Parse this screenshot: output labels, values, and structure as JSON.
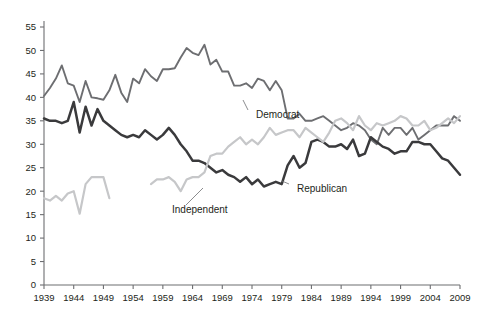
{
  "chart_data": {
    "type": "line",
    "title": "",
    "subtitle": "",
    "xlabel": "",
    "ylabel": "",
    "xlim": [
      1939,
      2009
    ],
    "ylim": [
      0,
      55
    ],
    "grid": false,
    "legend_position": "inline-annotations",
    "x_ticks": [
      1939,
      1944,
      1949,
      1954,
      1959,
      1964,
      1969,
      1974,
      1979,
      1984,
      1989,
      1994,
      1999,
      2004,
      2009
    ],
    "x_tick_labels": [
      "1939",
      "1944",
      "1949",
      "1954",
      "1959",
      "1964",
      "1969",
      "1974",
      "1979",
      "1984",
      "1989",
      "1994",
      "1999",
      "2004",
      "2009"
    ],
    "y_ticks": [
      0,
      5,
      10,
      15,
      20,
      25,
      30,
      35,
      40,
      45,
      50,
      55
    ],
    "y_tick_labels": [
      "0",
      "5",
      "10",
      "15",
      "20",
      "25",
      "30",
      "35",
      "40",
      "45",
      "50",
      "55"
    ],
    "annotations": [
      {
        "text": "Democrat",
        "x": 1972.0,
        "y": 37.0,
        "series": "Democrat"
      },
      {
        "text": "Independent",
        "x": 1966.0,
        "y": 13.5,
        "series": "Independent"
      },
      {
        "text": "Republican",
        "x": 1985.5,
        "y": 20.0,
        "series": "Republican"
      }
    ],
    "series": [
      {
        "name": "Democrat",
        "color": "#6d6e71",
        "x": [
          1939,
          1940,
          1941,
          1942,
          1943,
          1944,
          1945,
          1946,
          1947,
          1948,
          1949,
          1950,
          1951,
          1952,
          1953,
          1954,
          1955,
          1956,
          1957,
          1958,
          1959,
          1960,
          1961,
          1962,
          1963,
          1964,
          1965,
          1966,
          1967,
          1968,
          1969,
          1970,
          1971,
          1972,
          1973,
          1974,
          1975,
          1976,
          1977,
          1978,
          1979,
          1980,
          1981,
          1982,
          1983,
          1984,
          1985,
          1986,
          1987,
          1988,
          1989,
          1990,
          1991,
          1992,
          1993,
          1994,
          1995,
          1996,
          1997,
          1998,
          1999,
          2000,
          2001,
          2002,
          2003,
          2004,
          2005,
          2006,
          2007,
          2008,
          2009
        ],
        "y": [
          40.3,
          42.0,
          44.0,
          46.8,
          43.0,
          42.5,
          39.0,
          43.5,
          40.0,
          39.8,
          39.5,
          41.5,
          44.8,
          41.0,
          39.0,
          44.0,
          43.0,
          46.0,
          44.5,
          43.5,
          46.0,
          46.0,
          46.2,
          48.5,
          50.5,
          49.5,
          49.0,
          51.2,
          47.0,
          48.0,
          45.5,
          45.5,
          42.5,
          42.5,
          43.0,
          42.0,
          44.0,
          43.5,
          41.5,
          43.5,
          41.5,
          35.5,
          35.5,
          36.5,
          35.0,
          35.0,
          35.5,
          36.0,
          35.0,
          34.0,
          33.0,
          33.5,
          34.5,
          34.0,
          33.0,
          31.0,
          30.0,
          33.5,
          32.0,
          33.5,
          33.5,
          32.0,
          33.5,
          31.0,
          32.0,
          33.0,
          34.0,
          34.0,
          34.0,
          36.0,
          35.0
        ]
      },
      {
        "name": "Republican",
        "color": "#3a3a3c",
        "x": [
          1939,
          1940,
          1941,
          1942,
          1943,
          1944,
          1945,
          1946,
          1947,
          1948,
          1949,
          1950,
          1951,
          1952,
          1953,
          1954,
          1955,
          1956,
          1957,
          1958,
          1959,
          1960,
          1961,
          1962,
          1963,
          1964,
          1965,
          1966,
          1967,
          1968,
          1969,
          1970,
          1971,
          1972,
          1973,
          1974,
          1975,
          1976,
          1977,
          1978,
          1979,
          1980,
          1981,
          1982,
          1983,
          1984,
          1985,
          1986,
          1987,
          1988,
          1989,
          1990,
          1991,
          1992,
          1993,
          1994,
          1995,
          1996,
          1997,
          1998,
          1999,
          2000,
          2001,
          2002,
          2003,
          2004,
          2005,
          2006,
          2007,
          2008,
          2009
        ],
        "y": [
          35.5,
          35.0,
          35.0,
          34.5,
          35.0,
          39.0,
          32.5,
          38.0,
          34.0,
          37.5,
          35.0,
          34.0,
          33.0,
          32.0,
          31.5,
          32.0,
          31.5,
          33.0,
          32.0,
          31.0,
          32.0,
          33.5,
          32.0,
          30.0,
          28.5,
          26.5,
          26.5,
          26.0,
          25.0,
          24.0,
          24.5,
          23.5,
          23.0,
          22.0,
          23.0,
          21.5,
          22.5,
          21.0,
          21.5,
          22.0,
          21.5,
          25.5,
          27.5,
          25.0,
          26.0,
          30.5,
          31.0,
          30.5,
          29.5,
          29.5,
          30.0,
          29.0,
          31.0,
          27.5,
          28.0,
          31.5,
          30.5,
          29.5,
          29.0,
          28.0,
          28.5,
          28.5,
          30.5,
          30.5,
          30.0,
          30.0,
          28.5,
          27.0,
          26.5,
          25.0,
          23.5
        ]
      },
      {
        "name": "Independent",
        "color": "#c6c7c9",
        "x": [
          1939,
          1940,
          1941,
          1942,
          1943,
          1944,
          1945,
          1946,
          1947,
          1948,
          1949,
          1950,
          null,
          1957,
          1958,
          1959,
          1960,
          1961,
          1962,
          1963,
          1964,
          1965,
          1966,
          1967,
          1968,
          1969,
          1970,
          1971,
          1972,
          1973,
          1974,
          1975,
          1976,
          1977,
          1978,
          1979,
          1980,
          1981,
          1982,
          1983,
          1984,
          1985,
          1986,
          1987,
          1988,
          1989,
          1990,
          1991,
          1992,
          1993,
          1994,
          1995,
          1996,
          1997,
          1998,
          1999,
          2000,
          2001,
          2002,
          2003,
          2004,
          2005,
          2006,
          2007,
          2008,
          2009
        ],
        "y": [
          18.5,
          18.0,
          19.0,
          18.0,
          19.5,
          20.0,
          15.2,
          21.5,
          23.0,
          23.0,
          23.0,
          18.5,
          null,
          21.5,
          22.5,
          22.5,
          23.0,
          22.0,
          20.0,
          22.5,
          23.0,
          23.0,
          24.0,
          27.5,
          28.0,
          28.0,
          29.5,
          30.5,
          31.5,
          30.0,
          31.0,
          30.0,
          31.5,
          33.5,
          32.0,
          32.5,
          33.0,
          33.0,
          31.5,
          33.5,
          32.5,
          31.5,
          30.5,
          32.5,
          35.0,
          35.5,
          34.5,
          33.0,
          36.0,
          34.0,
          33.0,
          34.5,
          34.0,
          34.5,
          35.0,
          36.0,
          35.5,
          34.0,
          34.0,
          35.0,
          33.0,
          33.5,
          34.5,
          35.5,
          34.5,
          36.0
        ]
      }
    ]
  },
  "axes": {
    "y_axis_name": "percent-identifying",
    "x_axis_name": "year"
  }
}
